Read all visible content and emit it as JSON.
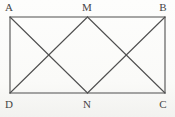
{
  "figure": {
    "type": "geometry-diagram",
    "line_color": "#4f4f4f",
    "label_color": "#454545",
    "background_color": "#fbfbf9",
    "vertices": {
      "A": {
        "label": "A",
        "x": 10,
        "y": 17,
        "label_x": 9,
        "label_y": 1
      },
      "M": {
        "label": "M",
        "x": 87.5,
        "y": 17,
        "label_x": 87,
        "label_y": 1
      },
      "B": {
        "label": "B",
        "x": 165,
        "y": 17,
        "label_x": 163,
        "label_y": 1
      },
      "D": {
        "label": "D",
        "x": 10,
        "y": 93,
        "label_x": 9,
        "label_y": 98
      },
      "N": {
        "label": "N",
        "x": 87.5,
        "y": 93,
        "label_x": 87,
        "label_y": 98
      },
      "C": {
        "label": "C",
        "x": 165,
        "y": 93,
        "label_x": 163,
        "label_y": 98
      }
    },
    "segments": [
      "A-B",
      "B-C",
      "C-D",
      "D-A",
      "A-N",
      "D-M",
      "M-C",
      "B-N"
    ]
  }
}
